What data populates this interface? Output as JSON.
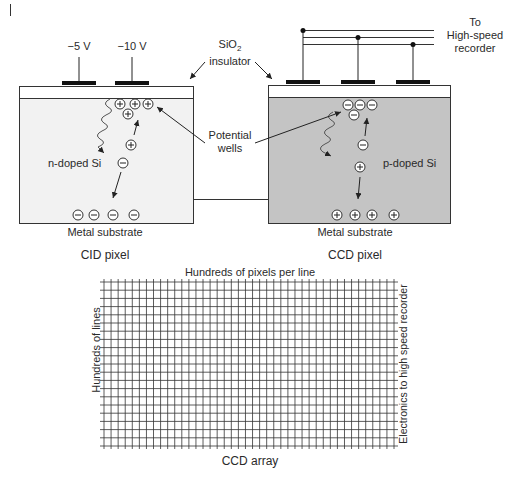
{
  "cid": {
    "voltages": [
      "−5 V",
      "−10 V"
    ],
    "region_label": "n-doped Si",
    "substrate_label": "Metal substrate",
    "title": "CID pixel",
    "well_charges": [
      "+",
      "+",
      "+",
      "+"
    ],
    "carriers": {
      "hole": "+",
      "electron": "−"
    },
    "substrate_charges": [
      "−",
      "−",
      "−",
      "−"
    ],
    "fill_color": "#f2f2f2"
  },
  "ccd": {
    "output_label_lines": [
      "To",
      "High-speed",
      "recorder"
    ],
    "region_label": "p-doped Si",
    "substrate_label": "Metal substrate",
    "title": "CCD pixel",
    "well_charges": [
      "−",
      "−",
      "−",
      "−"
    ],
    "carriers": {
      "electron": "−",
      "hole": "+"
    },
    "substrate_charges": [
      "+",
      "+",
      "+",
      "+"
    ],
    "fill_color": "#c4c4c4"
  },
  "shared": {
    "insulator_label_line1": "SiO",
    "insulator_label_sub": "2",
    "insulator_label_line2": "insulator",
    "wells_label_line1": "Potential",
    "wells_label_line2": "wells"
  },
  "array": {
    "top_label": "Hundreds of pixels per line",
    "left_label": "Hundreds of lines",
    "right_label": "Electronics to high speed recorder",
    "bottom_label": "CCD array",
    "columns": 41,
    "rows": 20,
    "line_color": "#333333"
  }
}
